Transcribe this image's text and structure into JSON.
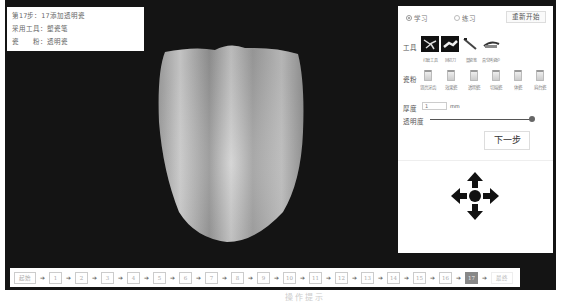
{
  "info": {
    "step_line": "第17步：17添加透明瓷",
    "tool_line": "采用工具：塑瓷笔",
    "material_line": "瓷　　粉：透明瓷"
  },
  "panel": {
    "modes": [
      {
        "label": "学习",
        "checked": true
      },
      {
        "label": "练习",
        "checked": false
      }
    ],
    "restart_label": "重新开始",
    "tools_label": "工具",
    "tools": [
      {
        "label": "打磨工具",
        "icon": "grinding-tool-icon"
      },
      {
        "label": "回切刀",
        "icon": "cutback-knife-icon"
      },
      {
        "label": "塑瓷笔",
        "icon": "porcelain-brush-icon"
      },
      {
        "label": "真空烤瓷炉",
        "icon": "vacuum-furnace-icon"
      }
    ],
    "porcelain_label": "瓷粉",
    "porcelain": [
      {
        "label": "竖亮牙齿"
      },
      {
        "label": "效果瓷"
      },
      {
        "label": "透明瓷"
      },
      {
        "label": "切端瓷"
      },
      {
        "label": "体瓷"
      },
      {
        "label": "肩台瓷"
      }
    ],
    "thickness_label": "厚度",
    "thickness_value": "1",
    "thickness_unit": "mm",
    "opacity_label": "透明度",
    "next_label": "下一步"
  },
  "stepbar": {
    "start_label": "起始",
    "steps": [
      "1",
      "2",
      "3",
      "4",
      "5",
      "6",
      "7",
      "8",
      "9",
      "10",
      "11",
      "12",
      "13",
      "14",
      "15",
      "16",
      "17"
    ],
    "active_step": "17",
    "end_label": "最终",
    "arrow": "➔"
  },
  "footer": {
    "text": "操作提示"
  }
}
